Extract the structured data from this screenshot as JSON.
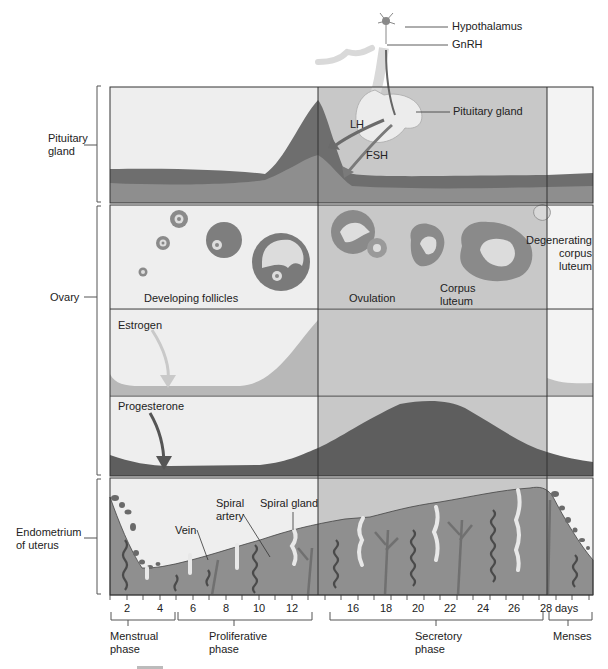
{
  "top_labels": {
    "hypothalamus": "Hypothalamus",
    "gnrh": "GnRH",
    "pituitary_gland": "Pituitary gland",
    "lh": "LH",
    "fsh": "FSH"
  },
  "side_labels": {
    "pituitary": [
      "Pituitary",
      "gland"
    ],
    "ovary": "Ovary",
    "endometrium": [
      "Endometrium",
      "of uterus"
    ]
  },
  "ovary_labels": {
    "developing_follicles": "Developing follicles",
    "ovulation": "Ovulation",
    "corpus_luteum": [
      "Corpus",
      "luteum"
    ],
    "degenerating": [
      "Degenerating",
      "corpus",
      "luteum"
    ]
  },
  "hormone_labels": {
    "estrogen": "Estrogen",
    "progesterone": "Progesterone"
  },
  "endometrium_labels": {
    "vein": "Vein",
    "spiral_artery": [
      "Spiral",
      "artery"
    ],
    "spiral_gland": "Spiral gland"
  },
  "axis": {
    "ticks": [
      "2",
      "4",
      "6",
      "8",
      "10",
      "12",
      "16",
      "18",
      "20",
      "22",
      "24",
      "26",
      "28"
    ],
    "unit": "days"
  },
  "phases": {
    "menstrual": [
      "Menstrual",
      "phase"
    ],
    "proliferative": [
      "Proliferative",
      "phase"
    ],
    "secretory": [
      "Secretory",
      "phase"
    ],
    "menses": "Menses"
  },
  "colors": {
    "panel_light": "#eeeeee",
    "panel_mid": "#c8c8c8",
    "curve_dark": "#5a5a5a",
    "curve_mid": "#7c7c7c",
    "estrogen_fill": "#b5b5b5",
    "tissue": "#8d8d8d",
    "outline": "#333333"
  }
}
